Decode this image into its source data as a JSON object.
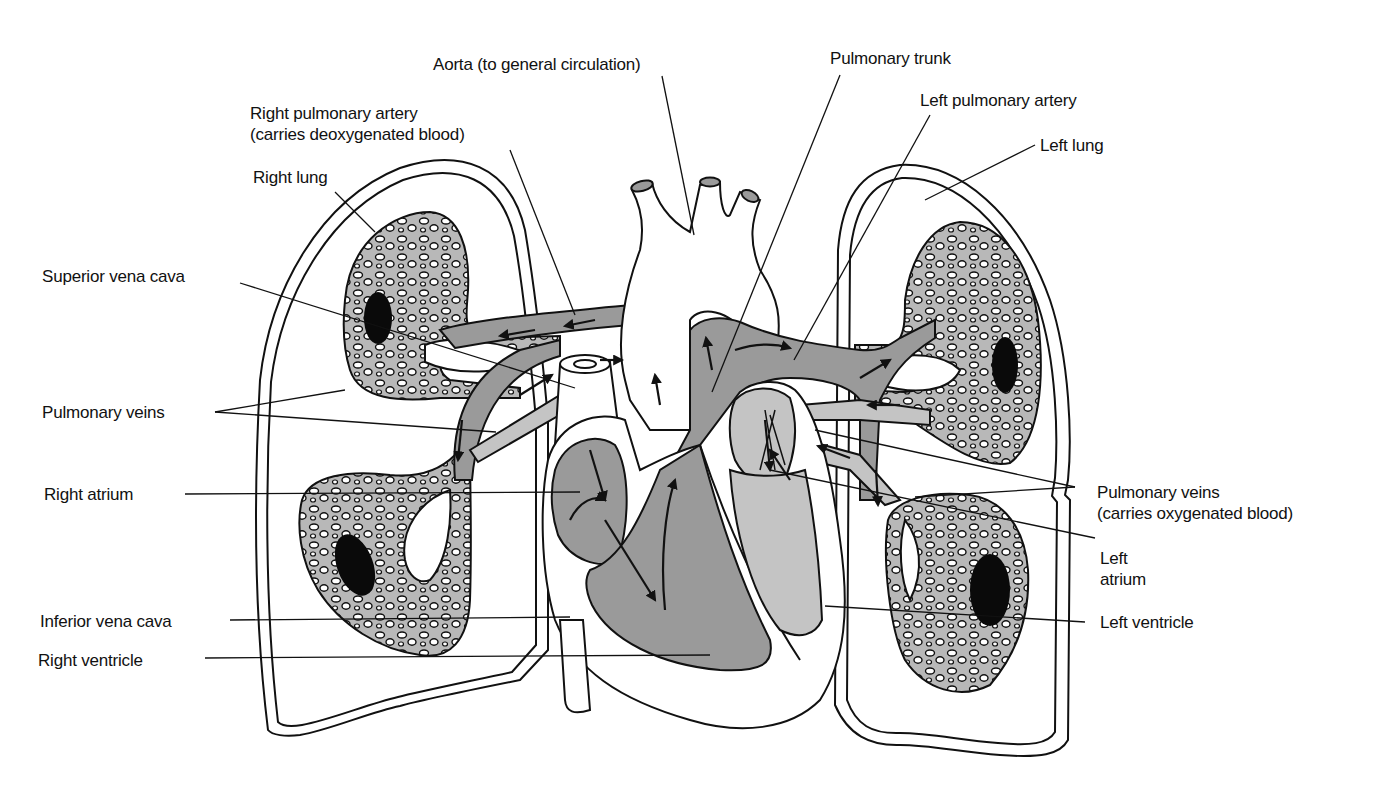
{
  "diagram": {
    "colors": {
      "background": "#ffffff",
      "outline": "#111111",
      "deoxygenated_fill": "#9a9a9a",
      "oxygenated_fill": "#c4c4c4",
      "lung_tissue_fill": "#b8b8b8",
      "hilum_dark": "#0a0a0a"
    },
    "labels": {
      "aorta": "Aorta (to general circulation)",
      "pulmonary_trunk": "Pulmonary trunk",
      "right_pulmonary_artery_line1": "Right pulmonary artery",
      "right_pulmonary_artery_line2": "(carries deoxygenated blood)",
      "left_pulmonary_artery": "Left pulmonary artery",
      "left_lung": "Left lung",
      "right_lung": "Right lung",
      "superior_vena_cava": "Superior vena cava",
      "pulmonary_veins_left_side": "Pulmonary veins",
      "right_atrium": "Right atrium",
      "inferior_vena_cava": "Inferior vena cava",
      "right_ventricle": "Right ventricle",
      "pulmonary_veins_right_line1": "Pulmonary veins",
      "pulmonary_veins_right_line2": "(carries oxygenated blood)",
      "left_atrium_line1": "Left",
      "left_atrium_line2": "atrium",
      "left_ventricle": "Left ventricle"
    }
  }
}
